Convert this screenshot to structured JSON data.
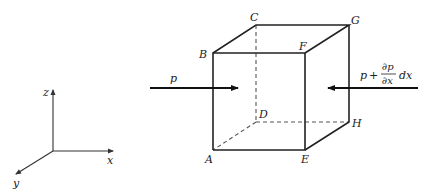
{
  "figure": {
    "type": "control-volume-cube"
  },
  "cube": {
    "vertices": {
      "A": "A",
      "B": "B",
      "C": "C",
      "D": "D",
      "E": "E",
      "F": "F",
      "G": "G",
      "H": "H"
    },
    "hidden_edges": [
      "C-D",
      "D-H",
      "D-A"
    ]
  },
  "forces": {
    "left": {
      "label": "p",
      "direction": "+x"
    },
    "right": {
      "label_p": "p",
      "label_plus": "+",
      "label_num": "∂p",
      "label_den": "∂x",
      "label_dx": "dx",
      "direction": "-x"
    }
  },
  "axes": {
    "x": "x",
    "y": "y",
    "z": "z"
  },
  "colors": {
    "line": "#222222",
    "hidden_line": "#555555",
    "background": "#ffffff"
  }
}
